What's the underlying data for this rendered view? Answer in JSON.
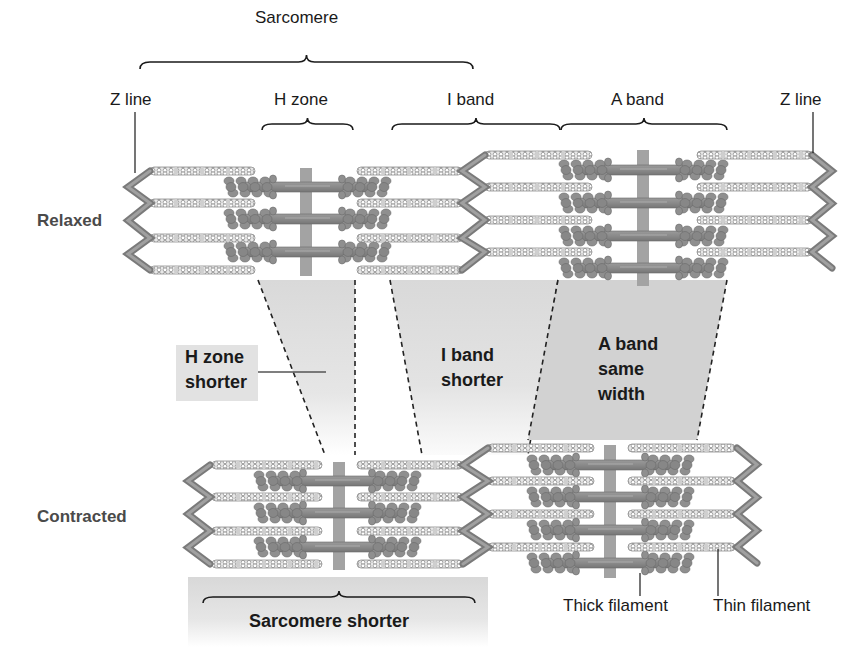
{
  "diagram": {
    "colors": {
      "filament": "#8a8a8a",
      "filament_dark": "#6f6f6f",
      "thin_fill": "#e6e6e6",
      "thin_stroke": "#8d8d8d",
      "mline": "#a3a3a3",
      "shade_light": "#dedede",
      "shade_dark": "#cfcfcf",
      "ink": "#1a1a1a"
    },
    "labels": {
      "sarcomere": "Sarcomere",
      "z_line_left": "Z line",
      "h_zone": "H zone",
      "i_band": "I band",
      "a_band": "A band",
      "z_line_right": "Z line",
      "relaxed": "Relaxed",
      "contracted": "Contracted",
      "h_zone_shorter_1": "H zone",
      "h_zone_shorter_2": "shorter",
      "i_band_shorter_1": "I band",
      "i_band_shorter_2": "shorter",
      "a_band_same_1": "A band",
      "a_band_same_2": "same",
      "a_band_same_3": "width",
      "sarcomere_shorter": "Sarcomere shorter",
      "thick_filament": "Thick filament",
      "thin_filament": "Thin filament"
    },
    "states": [
      {
        "name": "relaxed",
        "sarcomeres": [
          {
            "zLeft": 150,
            "zRight": 485,
            "thinY": [
              171,
              203,
              238,
              270
            ],
            "thinLeft": [
              150,
              255
            ],
            "thinRight": [
              357,
              462
            ],
            "thickY": [
              187,
              219,
              252
            ],
            "thickX": [
              225,
              390
            ],
            "mX": 306,
            "mY": [
              168,
              276
            ]
          },
          {
            "zLeft": 485,
            "zRight": 812,
            "thinY": [
              155,
              187,
              220,
              252
            ],
            "thinLeft": [
              485,
              592
            ],
            "thinRight": [
              697,
              812
            ],
            "thickY": [
              170,
              203,
              236,
              268
            ],
            "thickX": [
              560,
              727
            ],
            "mX": 643,
            "mY": [
              150,
              286
            ]
          }
        ]
      },
      {
        "name": "contracted",
        "sarcomeres": [
          {
            "zLeft": 210,
            "zRight": 465,
            "thinY": [
              465,
              497,
              531,
              564
            ],
            "thinLeft": [
              212,
              322
            ],
            "thinRight": [
              357,
              463
            ],
            "thickY": [
              481,
              513,
              547
            ],
            "thickX": [
              255,
              420
            ],
            "mX": 339,
            "mY": [
              462,
              570
            ]
          },
          {
            "zLeft": 488,
            "zRight": 737,
            "thinY": [
              448,
              481,
              514,
              547
            ],
            "thinLeft": [
              488,
              594
            ],
            "thinRight": [
              628,
              735
            ],
            "thickY": [
              465,
              497,
              530,
              563
            ],
            "thickX": [
              528,
              693
            ],
            "mX": 610,
            "mY": [
              445,
              578
            ]
          }
        ]
      }
    ],
    "zones": {
      "h_zone": {
        "top": [
          258,
          355
        ],
        "bottom": [
          325,
          355
        ],
        "yTop": 280,
        "yBot": 455
      },
      "i_band": {
        "top": [
          390,
          558
        ],
        "bottom": [
          422,
          528
        ],
        "yTop": 280,
        "yBot": 455
      },
      "a_band": {
        "top": [
          558,
          727
        ],
        "bottom": [
          528,
          697
        ],
        "yTop": 280,
        "yBot": 440
      }
    }
  }
}
